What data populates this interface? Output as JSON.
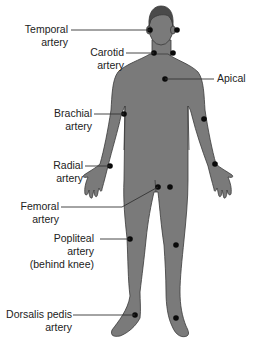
{
  "diagram": {
    "colors": {
      "body": "#7a7a7a",
      "hair": "#4a4a4a",
      "outline": "#3a3a3a",
      "dot": "#0a0a0a",
      "leader": "#333333",
      "text": "#222222"
    },
    "labels": {
      "temporal": [
        "Temporal",
        "artery"
      ],
      "carotid": [
        "Carotid",
        "artery"
      ],
      "apical": [
        "Apical"
      ],
      "brachial": [
        "Brachial",
        "artery"
      ],
      "radial": [
        "Radial",
        "artery"
      ],
      "femoral": [
        "Femoral",
        "artery"
      ],
      "popliteal": [
        "Popliteal",
        "artery",
        "(behind knee)"
      ],
      "dorsalis": [
        "Dorsalis pedis",
        "artery"
      ]
    }
  }
}
